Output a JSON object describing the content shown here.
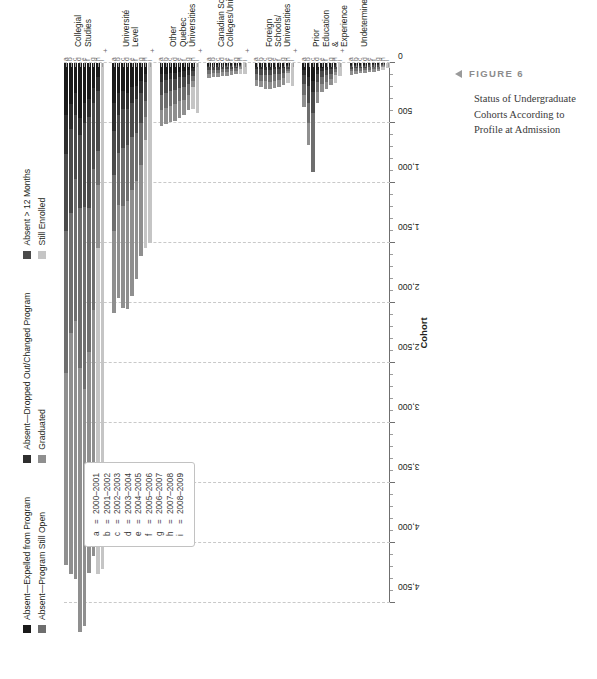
{
  "caption": {
    "figure_label": "FIGURE 6",
    "text": "Status of Undergraduate Cohorts According to Profile at Admission"
  },
  "legend": {
    "columns": [
      [
        {
          "label": "Absent—Expelled from Program",
          "color": "#1a1a1a"
        },
        {
          "label": "Absent—Program Still Open",
          "color": "#6e6e6e"
        }
      ],
      [
        {
          "label": "Absent—Dropped Out/Changed Program",
          "color": "#2e2e2e"
        },
        {
          "label": "Graduated",
          "color": "#8f8f8f"
        }
      ],
      [
        {
          "label": "Absent > 12 Months",
          "color": "#4a4a4a"
        },
        {
          "label": "Still Enrolled",
          "color": "#c5c5c5"
        }
      ]
    ]
  },
  "cohort_key": {
    "entries": [
      {
        "key": "a",
        "eq": "=",
        "years": "2000–2001"
      },
      {
        "key": "b",
        "eq": "=",
        "years": "2001–2002"
      },
      {
        "key": "c",
        "eq": "=",
        "years": "2002–2003"
      },
      {
        "key": "d",
        "eq": "=",
        "years": "2003–2004"
      },
      {
        "key": "e",
        "eq": "=",
        "years": "2004–2005"
      },
      {
        "key": "f",
        "eq": "=",
        "years": "2005–2006"
      },
      {
        "key": "g",
        "eq": "=",
        "years": "2006–2007"
      },
      {
        "key": "h",
        "eq": "=",
        "years": "2007–2008"
      },
      {
        "key": "i",
        "eq": "=",
        "years": "2008–2009"
      }
    ]
  },
  "chart_data": {
    "type": "bar",
    "orientation": "horizontal-stacked",
    "title": "Status of Undergraduate Cohorts According to Profile at Admission",
    "xlabel": "Cohort",
    "ylabel": "",
    "xlim": [
      0,
      4500
    ],
    "tick_step": 500,
    "grid": true,
    "legend_position": "top-left",
    "axis_ticks": [
      "0",
      "500",
      "1,000",
      "1,500",
      "2,000",
      "2,500",
      "3,000",
      "3,500",
      "4,000",
      "4,500"
    ],
    "cohort_letters": [
      "a",
      "b",
      "c",
      "d",
      "e",
      "f",
      "g",
      "h",
      "i"
    ],
    "series": [
      {
        "name": "Absent—Expelled from Program",
        "color": "#1a1a1a"
      },
      {
        "name": "Absent—Dropped Out/Changed Program",
        "color": "#2e2e2e"
      },
      {
        "name": "Absent > 12 Months",
        "color": "#4a4a4a"
      },
      {
        "name": "Absent—Program Still Open",
        "color": "#6e6e6e"
      },
      {
        "name": "Graduated",
        "color": "#8f8f8f"
      },
      {
        "name": "Still Enrolled",
        "color": "#c5c5c5"
      }
    ],
    "groups": [
      {
        "name": "Collegial\nStudies",
        "rows": [
          {
            "cohort": "a",
            "values": [
              430,
              330,
              640,
              1180,
              1600,
              0
            ]
          },
          {
            "cohort": "b",
            "values": [
              340,
              210,
              700,
              1000,
              2010,
              0
            ]
          },
          {
            "cohort": "c",
            "values": [
              250,
              180,
              540,
              1180,
              2150,
              0
            ]
          },
          {
            "cohort": "d",
            "values": [
              460,
              140,
              610,
              1330,
              2200,
              0
            ]
          },
          {
            "cohort": "e",
            "values": [
              330,
              170,
              700,
              1520,
              1970,
              0
            ]
          },
          {
            "cohort": "f",
            "values": [
              300,
              150,
              760,
              1200,
              1840,
              0
            ]
          },
          {
            "cohort": "g",
            "values": [
              210,
              120,
              550,
              1180,
              2050,
              0
            ]
          },
          {
            "cohort": "h",
            "values": [
              120,
              110,
              500,
              290,
              520,
              2720
            ]
          },
          {
            "cohort": "i",
            "values": [
              0,
              0,
              0,
              0,
              0,
              4220
            ]
          }
        ]
      },
      {
        "name": "Université\nLevel",
        "rows": [
          {
            "cohort": "a",
            "values": [
              330,
              240,
              360,
              470,
              680,
              0
            ]
          },
          {
            "cohort": "b",
            "values": [
              250,
              180,
              320,
              430,
              780,
              0
            ]
          },
          {
            "cohort": "c",
            "values": [
              230,
              150,
              330,
              480,
              850,
              0
            ]
          },
          {
            "cohort": "d",
            "values": [
              250,
              130,
              300,
              470,
              900,
              0
            ]
          },
          {
            "cohort": "e",
            "values": [
              200,
              130,
              290,
              440,
              880,
              0
            ]
          },
          {
            "cohort": "f",
            "values": [
              190,
              110,
              280,
              400,
              820,
              0
            ]
          },
          {
            "cohort": "g",
            "values": [
              150,
              100,
              250,
              350,
              760,
              0
            ]
          },
          {
            "cohort": "h",
            "values": [
              90,
              70,
              160,
              130,
              190,
              900
            ]
          },
          {
            "cohort": "i",
            "values": [
              0,
              0,
              0,
              0,
              0,
              1500
            ]
          }
        ]
      },
      {
        "name": "Other Quebec\nUniversities",
        "rows": [
          {
            "cohort": "a",
            "values": [
              95,
              60,
              110,
              130,
              130,
              0
            ]
          },
          {
            "cohort": "b",
            "values": [
              90,
              55,
              105,
              125,
              135,
              0
            ]
          },
          {
            "cohort": "c",
            "values": [
              85,
              50,
              100,
              120,
              140,
              0
            ]
          },
          {
            "cohort": "d",
            "values": [
              80,
              50,
              95,
              115,
              145,
              0
            ]
          },
          {
            "cohort": "e",
            "values": [
              75,
              45,
              90,
              110,
              140,
              0
            ]
          },
          {
            "cohort": "f",
            "values": [
              70,
              45,
              85,
              105,
              130,
              0
            ]
          },
          {
            "cohort": "g",
            "values": [
              60,
              40,
              75,
              95,
              120,
              0
            ]
          },
          {
            "cohort": "h",
            "values": [
              40,
              25,
              45,
              40,
              50,
              180
            ]
          },
          {
            "cohort": "i",
            "values": [
              0,
              0,
              0,
              0,
              0,
              420
            ]
          }
        ]
      },
      {
        "name": "Canadian Schools/\nColleges/Universities",
        "rows": [
          {
            "cohort": "a",
            "values": [
              22,
              14,
              26,
              30,
              30,
              0
            ]
          },
          {
            "cohort": "b",
            "values": [
              20,
              13,
              24,
              28,
              32,
              0
            ]
          },
          {
            "cohort": "c",
            "values": [
              20,
              12,
              24,
              28,
              33,
              0
            ]
          },
          {
            "cohort": "d",
            "values": [
              18,
              12,
              22,
              26,
              34,
              0
            ]
          },
          {
            "cohort": "e",
            "values": [
              18,
              11,
              22,
              26,
              33,
              0
            ]
          },
          {
            "cohort": "f",
            "values": [
              16,
              10,
              20,
              24,
              30,
              0
            ]
          },
          {
            "cohort": "g",
            "values": [
              14,
              9,
              18,
              22,
              28,
              0
            ]
          },
          {
            "cohort": "h",
            "values": [
              9,
              6,
              11,
              10,
              12,
              42
            ]
          },
          {
            "cohort": "i",
            "values": [
              0,
              0,
              0,
              0,
              0,
              95
            ]
          }
        ]
      },
      {
        "name": "Foreign Schools/\nUniversities",
        "rows": [
          {
            "cohort": "a",
            "values": [
              30,
              22,
              40,
              48,
              50,
              0
            ]
          },
          {
            "cohort": "b",
            "values": [
              32,
              22,
              42,
              52,
              56,
              0
            ]
          },
          {
            "cohort": "c",
            "values": [
              34,
              22,
              44,
              54,
              60,
              0
            ]
          },
          {
            "cohort": "d",
            "values": [
              34,
              22,
              44,
              56,
              64,
              0
            ]
          },
          {
            "cohort": "e",
            "values": [
              32,
              20,
              42,
              54,
              62,
              0
            ]
          },
          {
            "cohort": "f",
            "values": [
              30,
              20,
              40,
              50,
              58,
              0
            ]
          },
          {
            "cohort": "g",
            "values": [
              26,
              18,
              36,
              46,
              54,
              0
            ]
          },
          {
            "cohort": "h",
            "values": [
              16,
              11,
              20,
              18,
              22,
              80
            ]
          },
          {
            "cohort": "i",
            "values": [
              0,
              0,
              0,
              0,
              0,
              190
            ]
          }
        ]
      },
      {
        "name": "Prior Education\n& Experience",
        "rows": [
          {
            "cohort": "a",
            "values": [
              60,
              40,
              75,
              95,
              100,
              0
            ]
          },
          {
            "cohort": "b",
            "values": [
              120,
              70,
              140,
              170,
              180,
              0
            ]
          },
          {
            "cohort": "c",
            "values": [
              150,
              90,
              175,
              490,
              0,
              0
            ]
          },
          {
            "cohort": "d",
            "values": [
              55,
              35,
              65,
              85,
              90,
              0
            ]
          },
          {
            "cohort": "e",
            "values": [
              40,
              25,
              50,
              60,
              65,
              0
            ]
          },
          {
            "cohort": "f",
            "values": [
              35,
              22,
              44,
              54,
              58,
              0
            ]
          },
          {
            "cohort": "g",
            "values": [
              30,
              20,
              38,
              46,
              50,
              0
            ]
          },
          {
            "cohort": "h",
            "values": [
              18,
              12,
              22,
              20,
              24,
              70
            ]
          },
          {
            "cohort": "i",
            "values": [
              0,
              0,
              0,
              0,
              0,
              110
            ]
          }
        ]
      },
      {
        "name": "Undetermined",
        "rows": [
          {
            "cohort": "a",
            "values": [
              16,
              10,
              20,
              24,
              26,
              0
            ]
          },
          {
            "cohort": "b",
            "values": [
              15,
              10,
              19,
              23,
              25,
              0
            ]
          },
          {
            "cohort": "c",
            "values": [
              14,
              9,
              18,
              22,
              24,
              0
            ]
          },
          {
            "cohort": "d",
            "values": [
              13,
              9,
              17,
              21,
              23,
              0
            ]
          },
          {
            "cohort": "e",
            "values": [
              12,
              8,
              16,
              20,
              22,
              0
            ]
          },
          {
            "cohort": "f",
            "values": [
              11,
              8,
              15,
              18,
              20,
              0
            ]
          },
          {
            "cohort": "g",
            "values": [
              10,
              7,
              13,
              16,
              18,
              0
            ]
          },
          {
            "cohort": "h",
            "values": [
              6,
              4,
              8,
              7,
              9,
              26
            ]
          },
          {
            "cohort": "i",
            "values": [
              0,
              0,
              0,
              0,
              0,
              40
            ]
          }
        ]
      }
    ]
  }
}
